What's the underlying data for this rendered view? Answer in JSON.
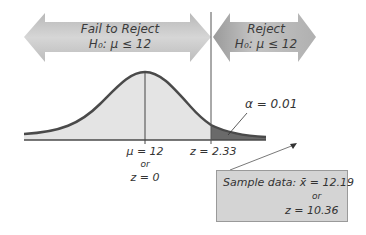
{
  "regions": {
    "fail_to_reject": {
      "title": "Fail to Reject",
      "hypothesis": "H₀: μ ≤ 12"
    },
    "reject": {
      "title": "Reject",
      "hypothesis": "H₀: μ ≤ 12"
    }
  },
  "axis_labels": {
    "mean": {
      "line1": "μ = 12",
      "line2": "or",
      "line3": "z = 0"
    },
    "critical": "z = 2.33"
  },
  "alpha_label": "α = 0.01",
  "sample_box": {
    "line1": "Sample data: x̄ = 12.19",
    "line2": "or",
    "line3": "z = 10.36"
  },
  "colors": {
    "arrow_fill": "#c8c8c8",
    "curve_fill": "#e4e4e4",
    "tail_fill": "#6a6a6a",
    "curve_stroke": "#4a4a4a",
    "box_fill": "#d4d4d4"
  }
}
